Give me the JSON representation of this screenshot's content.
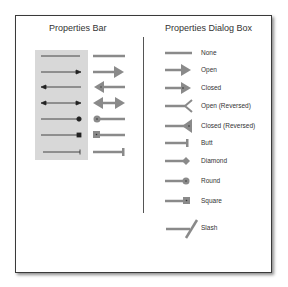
{
  "left_panel": {
    "title": "Properties Bar",
    "rows": [
      {
        "name": "none"
      },
      {
        "name": "end-arrow"
      },
      {
        "name": "start-arrow"
      },
      {
        "name": "both-arrows"
      },
      {
        "name": "round"
      },
      {
        "name": "square"
      },
      {
        "name": "butt"
      }
    ]
  },
  "right_panel": {
    "title": "Properties Dialog Box",
    "items": [
      {
        "label": "None"
      },
      {
        "label": "Open"
      },
      {
        "label": "Closed"
      },
      {
        "label": "Open (Reversed)"
      },
      {
        "label": "Closed  (Reversed)"
      },
      {
        "label": "Butt"
      },
      {
        "label": "Diamond"
      },
      {
        "label": "Round"
      },
      {
        "label": "Square"
      },
      {
        "label": "Slash"
      }
    ]
  },
  "colors": {
    "line_thin": "#222222",
    "line_thick": "#8a8a8a",
    "panel_shade": "#d8d8d8",
    "frame_border": "#3a3a3a"
  }
}
